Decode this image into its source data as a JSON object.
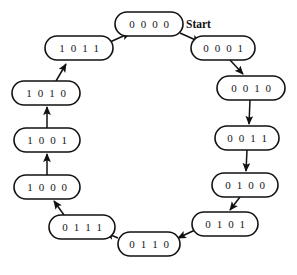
{
  "diagram": {
    "background_color": "#ffffff",
    "node_fill": "#ffffff",
    "node_stroke": "#111111",
    "edge_color": "#111111",
    "start_label": "Start",
    "nodes": [
      {
        "id": "s0",
        "label": "0 0 0 0",
        "cx": 149,
        "cy": 24,
        "rx": 34,
        "ry": 12
      },
      {
        "id": "s1",
        "label": "0 0 0 1",
        "cx": 223,
        "cy": 48,
        "rx": 32,
        "ry": 12
      },
      {
        "id": "s2",
        "label": "0 0 1 0",
        "cx": 251,
        "cy": 88,
        "rx": 34,
        "ry": 12
      },
      {
        "id": "s3",
        "label": "0 0 1 1",
        "cx": 247,
        "cy": 138,
        "rx": 32,
        "ry": 12
      },
      {
        "id": "s4",
        "label": "0 1 0 0",
        "cx": 245,
        "cy": 185,
        "rx": 33,
        "ry": 12
      },
      {
        "id": "s5",
        "label": "0 1 0 1",
        "cx": 225,
        "cy": 224,
        "rx": 33,
        "ry": 12
      },
      {
        "id": "s6",
        "label": "0 1 1 0",
        "cx": 149,
        "cy": 244,
        "rx": 31,
        "ry": 12
      },
      {
        "id": "s7",
        "label": "0 1 1 1",
        "cx": 82,
        "cy": 227,
        "rx": 33,
        "ry": 12
      },
      {
        "id": "s8",
        "label": "1 0 0 0",
        "cx": 47,
        "cy": 187,
        "rx": 33,
        "ry": 12
      },
      {
        "id": "s9",
        "label": "1 0 0 1",
        "cx": 47,
        "cy": 140,
        "rx": 33,
        "ry": 12
      },
      {
        "id": "s10",
        "label": "1 0 1 0",
        "cx": 46,
        "cy": 93,
        "rx": 34,
        "ry": 12
      },
      {
        "id": "s11",
        "label": "1 0 1 1",
        "cx": 79,
        "cy": 48,
        "rx": 34,
        "ry": 12
      }
    ],
    "edges": [
      {
        "from": "s0",
        "to": "s1",
        "x1": 180,
        "y1": 33,
        "x2": 200,
        "y2": 42
      },
      {
        "from": "s1",
        "to": "s2",
        "x1": 230,
        "y1": 60,
        "x2": 243,
        "y2": 74
      },
      {
        "from": "s2",
        "to": "s3",
        "x1": 250,
        "y1": 100,
        "x2": 249,
        "y2": 124
      },
      {
        "from": "s3",
        "to": "s4",
        "x1": 247,
        "y1": 150,
        "x2": 246,
        "y2": 171
      },
      {
        "from": "s4",
        "to": "s5",
        "x1": 240,
        "y1": 197,
        "x2": 230,
        "y2": 210
      },
      {
        "from": "s5",
        "to": "s6",
        "x1": 195,
        "y1": 230,
        "x2": 178,
        "y2": 238
      },
      {
        "from": "s6",
        "to": "s7",
        "x1": 118,
        "y1": 238,
        "x2": 106,
        "y2": 233
      },
      {
        "from": "s7",
        "to": "s8",
        "x1": 64,
        "y1": 215,
        "x2": 54,
        "y2": 201
      },
      {
        "from": "s8",
        "to": "s9",
        "x1": 47,
        "y1": 175,
        "x2": 47,
        "y2": 154
      },
      {
        "from": "s9",
        "to": "s10",
        "x1": 47,
        "y1": 128,
        "x2": 47,
        "y2": 107
      },
      {
        "from": "s10",
        "to": "s11",
        "x1": 56,
        "y1": 81,
        "x2": 66,
        "y2": 64
      },
      {
        "from": "s11",
        "to": "s0",
        "x1": 110,
        "y1": 42,
        "x2": 130,
        "y2": 33
      }
    ],
    "start_marker": {
      "x": 186,
      "y": 25
    }
  }
}
